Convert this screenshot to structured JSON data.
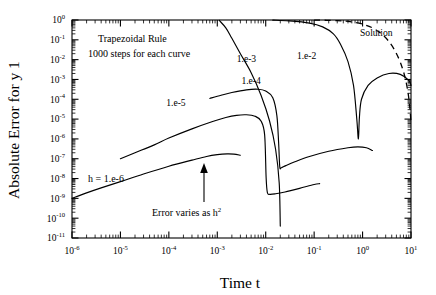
{
  "figure": {
    "xlabel": "Time t",
    "ylabel": "Absolute Error for y 1",
    "annotations": {
      "method": "Trapezoidal Rule",
      "steps": "1000 steps for each curve",
      "h_label": "h = 1.e-6",
      "error_note": "Error varies as h",
      "error_note_exp": "2",
      "solution_label": "Solution"
    }
  },
  "chart_data": {
    "type": "line",
    "title": "",
    "subtitle": "",
    "xlabel": "Time t",
    "ylabel": "Absolute Error for y 1",
    "xscale": "log",
    "yscale": "log",
    "xlim": [
      1e-06,
      10
    ],
    "ylim": [
      1e-11,
      1
    ],
    "grid": false,
    "legend_position": "inline-curve-labels",
    "xticks": [
      1e-06,
      1e-05,
      0.0001,
      0.001,
      0.01,
      0.1,
      1,
      10
    ],
    "xtick_labels": [
      "10-6",
      "10-5",
      "10-4",
      "10-3",
      "10-2",
      "10-1",
      "100",
      "101"
    ],
    "xtick_mantissas": [
      "10",
      "10",
      "10",
      "10",
      "10",
      "10",
      "10",
      "10"
    ],
    "xtick_exponents": [
      "-6",
      "-5",
      "-4",
      "-3",
      "-2",
      "-1",
      "0",
      "1"
    ],
    "yticks": [
      1e-11,
      1e-10,
      1e-09,
      1e-08,
      1e-07,
      1e-06,
      1e-05,
      0.0001,
      0.001,
      0.01,
      0.1,
      1
    ],
    "ytick_mantissas": [
      "10",
      "10",
      "10",
      "10",
      "10",
      "10",
      "10",
      "10",
      "10",
      "10",
      "10",
      "10"
    ],
    "ytick_exponents": [
      "-11",
      "-10",
      "-9",
      "-8",
      "-7",
      "-6",
      "-5",
      "-4",
      "-3",
      "-2",
      "-1",
      "0"
    ],
    "annotations": [
      {
        "text": "Trapezoidal Rule",
        "x": 2e-05,
        "y": 0.12
      },
      {
        "text": "1000 steps for each curve",
        "x": 1.3e-05,
        "y": 0.022
      },
      {
        "text": "h = 1.e-6",
        "x": 1.6e-05,
        "y": 2e-07
      },
      {
        "text": "Error varies as h^2",
        "x": 0.00011,
        "y": 6e-10
      },
      {
        "text": "Solution",
        "x": 1.6,
        "y": 0.3
      }
    ],
    "series": [
      {
        "name": "h = 1.e-6",
        "label": "h = 1.e-6",
        "style": "solid",
        "points": [
          [
            1e-06,
            1e-09
          ],
          [
            2e-06,
            1.9e-09
          ],
          [
            4e-06,
            3.4e-09
          ],
          [
            1e-05,
            7e-09
          ],
          [
            3e-05,
            1.7e-08
          ],
          [
            0.0001,
            4.2e-08
          ],
          [
            0.0003,
            8.5e-08
          ],
          [
            0.0006,
            1.3e-07
          ],
          [
            0.001,
            1.6e-07
          ],
          [
            0.0016,
            1.75e-07
          ],
          [
            0.0022,
            1.7e-07
          ],
          [
            0.003,
            1.5e-07
          ]
        ]
      },
      {
        "name": "h = 1.e-5",
        "label": "1.e-5",
        "style": "solid",
        "points": [
          [
            1e-05,
            1e-07
          ],
          [
            2e-05,
            2e-07
          ],
          [
            5e-05,
            5e-07
          ],
          [
            0.0001,
            1.1e-06
          ],
          [
            0.0003,
            3.2e-06
          ],
          [
            0.0008,
            7.5e-06
          ],
          [
            0.0015,
            1.2e-05
          ],
          [
            0.0025,
            1.55e-05
          ],
          [
            0.004,
            1.65e-05
          ],
          [
            0.006,
            1.4e-05
          ],
          [
            0.008,
            8e-06
          ],
          [
            0.0095,
            1.6e-06
          ],
          [
            0.0102,
            1.1e-08
          ],
          [
            0.0108,
            2e-09
          ],
          [
            0.012,
            1.6e-09
          ],
          [
            0.016,
            1.7e-09
          ],
          [
            0.025,
            2.1e-09
          ],
          [
            0.05,
            3.2e-09
          ],
          [
            0.1,
            5e-09
          ],
          [
            0.13,
            5.5e-09
          ]
        ]
      },
      {
        "name": "h = 1.e-4",
        "label": "1.e-4",
        "style": "solid",
        "points": [
          [
            0.0007,
            0.00011
          ],
          [
            0.0012,
            0.00016
          ],
          [
            0.002,
            0.00022
          ],
          [
            0.004,
            0.0003
          ],
          [
            0.007,
            0.00032
          ],
          [
            0.01,
            0.00026
          ],
          [
            0.014,
            0.00012
          ],
          [
            0.017,
            1.5e-05
          ],
          [
            0.0185,
            6e-07
          ],
          [
            0.0195,
            4e-08
          ],
          [
            0.021,
            3.5e-08
          ],
          [
            0.026,
            4.5e-08
          ],
          [
            0.04,
            7e-08
          ],
          [
            0.08,
            1.3e-07
          ],
          [
            0.2,
            2.4e-07
          ],
          [
            0.5,
            3.6e-07
          ],
          [
            0.8,
            4e-07
          ],
          [
            1.2,
            3.6e-07
          ],
          [
            1.6,
            2.6e-07
          ]
        ]
      },
      {
        "name": "h = 1.e-3",
        "label": "1.e-3",
        "style": "solid",
        "points": [
          [
            0.0011,
            0.95
          ],
          [
            0.0015,
            0.4
          ],
          [
            0.002,
            0.12
          ],
          [
            0.003,
            0.02
          ],
          [
            0.005,
            0.0022
          ],
          [
            0.008,
            0.00016
          ],
          [
            0.012,
            8e-06
          ],
          [
            0.016,
            3e-07
          ],
          [
            0.019,
            6e-09
          ],
          [
            0.02,
            4e-11
          ]
        ]
      },
      {
        "name": "h = 1.e-2",
        "label": "1.e-2",
        "style": "solid",
        "points": [
          [
            0.014,
            0.98
          ],
          [
            0.03,
            0.9
          ],
          [
            0.08,
            0.7
          ],
          [
            0.15,
            0.45
          ],
          [
            0.25,
            0.2
          ],
          [
            0.35,
            0.06
          ],
          [
            0.5,
            0.008
          ],
          [
            0.65,
            0.0005
          ],
          [
            0.76,
            1e-05
          ],
          [
            0.82,
            1e-06
          ],
          [
            0.86,
            1.2e-05
          ],
          [
            0.95,
            0.0001
          ],
          [
            1.3,
            0.0005
          ],
          [
            2.0,
            0.0012
          ],
          [
            3.5,
            0.002
          ],
          [
            6.0,
            0.0018
          ],
          [
            9.0,
            0.0009
          ],
          [
            10.0,
            0.0005
          ]
        ]
      },
      {
        "name": "Solution",
        "label": "Solution",
        "style": "dashed",
        "points": [
          [
            0.1,
            0.99
          ],
          [
            0.3,
            0.93
          ],
          [
            0.6,
            0.8
          ],
          [
            1.0,
            0.62
          ],
          [
            1.6,
            0.4
          ],
          [
            2.4,
            0.21
          ],
          [
            3.4,
            0.09
          ],
          [
            4.6,
            0.03
          ],
          [
            6.0,
            0.0075
          ],
          [
            7.4,
            0.0015
          ],
          [
            8.6,
            0.00025
          ],
          [
            9.5,
            3.5e-05
          ],
          [
            10.0,
            6e-06
          ]
        ]
      }
    ]
  }
}
